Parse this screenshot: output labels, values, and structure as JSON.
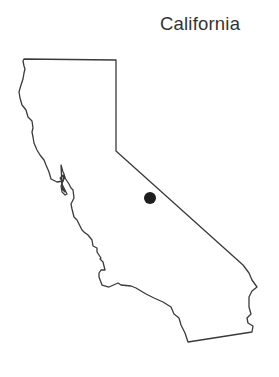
{
  "map": {
    "title": "California",
    "region": "California",
    "outline_color": "#3a3a3a",
    "background_color": "#ffffff",
    "marker": {
      "shape": "filled-circle",
      "color": "#1e1e1e",
      "x": 150,
      "y": 198,
      "radius": 6
    }
  }
}
